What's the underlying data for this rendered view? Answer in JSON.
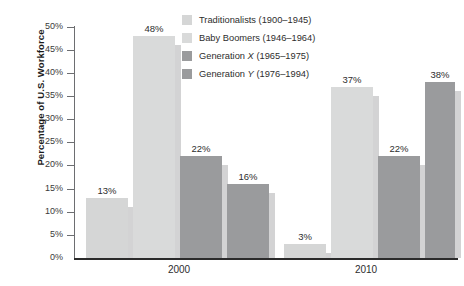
{
  "chart_data": {
    "type": "bar",
    "title": "",
    "subtitle": "",
    "xlabel": "",
    "ylabel": "Percentage of U.S. Workforce",
    "categories": [
      "2000",
      "2010"
    ],
    "ylim": [
      0,
      50
    ],
    "ytick_labels": [
      "0%",
      "5%",
      "10%",
      "15%",
      "20%",
      "25%",
      "30%",
      "35%",
      "40%",
      "45%",
      "50%"
    ],
    "ytick_values": [
      0,
      5,
      10,
      15,
      20,
      25,
      30,
      35,
      40,
      45,
      50
    ],
    "grid": false,
    "legend_position": "top-right",
    "series": [
      {
        "name": "Traditionalists (1900–1945)",
        "name_prefix": "Traditionalists",
        "name_suffix": " (1900–1945)",
        "color": "#d5d6d6",
        "values": [
          13,
          3
        ],
        "labels": [
          "13%",
          "3%"
        ]
      },
      {
        "name": "Baby Boomers (1946–1964)",
        "name_prefix": "Baby Boomers",
        "name_suffix": " (1946–1964)",
        "color": "#d9dada",
        "values": [
          48,
          37
        ],
        "labels": [
          "48%",
          "37%"
        ]
      },
      {
        "name": "Generation X (1965–1975)",
        "name_prefix": "Generation ",
        "name_italic": "X",
        "name_suffix": " (1965–1975)",
        "color": "#9a9b9d",
        "values": [
          22,
          22
        ],
        "labels": [
          "22%",
          "22%"
        ]
      },
      {
        "name": "Generation Y (1976–1994)",
        "name_prefix": "Generation ",
        "name_italic": "Y",
        "name_suffix": " (1976–1994)",
        "color": "#9a9b9d",
        "values": [
          16,
          38
        ],
        "labels": [
          "16%",
          "38%"
        ]
      }
    ]
  },
  "axis": {
    "axis_color": "#2b2b2b",
    "tick_color": "#6d6e71"
  }
}
